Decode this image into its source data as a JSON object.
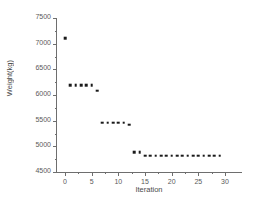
{
  "chart_data": {
    "type": "scatter",
    "title": "",
    "xlabel": "Iteration",
    "ylabel": "Weight(kg)",
    "xlim": [
      -1.5,
      33
    ],
    "ylim": [
      4500,
      7500
    ],
    "grid": false,
    "legend": null,
    "marker": "square",
    "marker_color": "#1a1a1a",
    "xticks": [
      0,
      5,
      10,
      15,
      20,
      25,
      30
    ],
    "xtick_labels": [
      "0",
      "5",
      "10",
      "15",
      "20",
      "25",
      "30"
    ],
    "yticks": [
      4500,
      5000,
      5500,
      6000,
      6500,
      7000,
      7500
    ],
    "ytick_labels": [
      "4500",
      "5000",
      "5500",
      "6000",
      "6500",
      "7000",
      "7500"
    ],
    "x": [
      0,
      1,
      2,
      3,
      4,
      5,
      6,
      7,
      8,
      9,
      10,
      11,
      12,
      13,
      14,
      15,
      16,
      17,
      18,
      19,
      20,
      21,
      22,
      23,
      24,
      25,
      26,
      27,
      28,
      29
    ],
    "values": [
      7110,
      6190,
      6190,
      6190,
      6190,
      6190,
      6080,
      5460,
      5460,
      5460,
      5460,
      5460,
      5420,
      4890,
      4890,
      4820,
      4820,
      4820,
      4820,
      4820,
      4820,
      4820,
      4820,
      4820,
      4820,
      4820,
      4820,
      4820,
      4820,
      4820
    ]
  },
  "axes": {
    "x_title": "Iteration",
    "y_title": "Weight(kg)"
  }
}
